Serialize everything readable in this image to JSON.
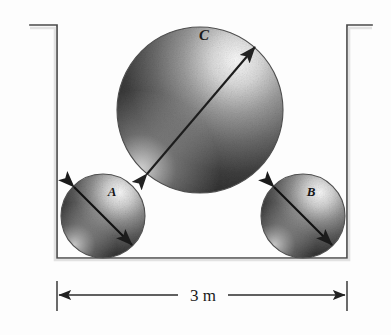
{
  "figure": {
    "kind": "engineering-diagram",
    "background_color": "#fdfdfd",
    "ink_color": "#3a3a3a"
  },
  "container": {
    "name": "open-top-box",
    "left_wall_x": 57,
    "right_wall_x": 347,
    "floor_y": 258,
    "wall_top_y": 25,
    "left_lip_x": 30,
    "right_lip_x": 372,
    "stroke_color": "#4a4a4a"
  },
  "spheres": [
    {
      "label": "A",
      "name": "sphere-a",
      "cx": 103,
      "cy": 216,
      "r": 42,
      "label_x": 112,
      "label_y": 196,
      "arrow_angle_deg": 135,
      "fill_light": "#f2f2f2",
      "fill_dark": "#2e2e2e"
    },
    {
      "label": "C",
      "name": "sphere-c",
      "cx": 200,
      "cy": 110,
      "r": 83,
      "label_x": 204,
      "label_y": 40,
      "arrow_angle_deg": 125,
      "fill_light": "#f4f4f4",
      "fill_dark": "#2a2a2a"
    },
    {
      "label": "B",
      "name": "sphere-b",
      "cx": 303,
      "cy": 216,
      "r": 42,
      "label_x": 311,
      "label_y": 196,
      "arrow_angle_deg": 135,
      "fill_light": "#f2f2f2",
      "fill_dark": "#2e2e2e"
    }
  ],
  "dimension": {
    "name": "overall-width",
    "value_label": "3 m",
    "line_y": 295,
    "start_x": 57,
    "end_x": 347,
    "tick_top_y": 281,
    "tick_bottom_y": 311,
    "text_x": 202,
    "text_y": 300
  },
  "caption": {
    "text": ""
  }
}
